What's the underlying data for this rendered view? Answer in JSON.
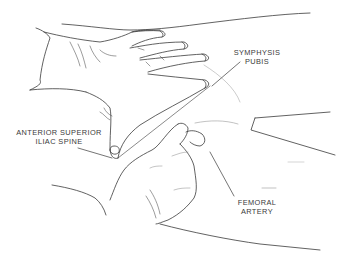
{
  "figure": {
    "line_color": "#3a3a3a",
    "background": "#ffffff"
  },
  "labels": {
    "symphysis_pubis": {
      "line1": "SYMPHYSIS",
      "line2": "PUBIS"
    },
    "anterior_superior_iliac_spine": {
      "line1": "ANTERIOR SUPERIOR",
      "line2": "ILIAC SPINE"
    },
    "femoral_artery": {
      "line1": "FEMORAL",
      "line2": "ARTERY"
    }
  }
}
